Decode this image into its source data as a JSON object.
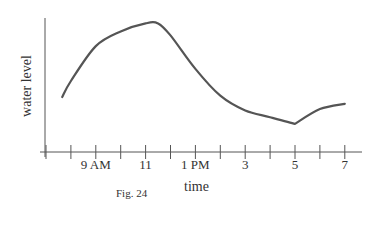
{
  "chart_data": {
    "type": "line",
    "title": "",
    "caption": "Fig. 24",
    "xlabel": "time",
    "ylabel": "water level",
    "x_ticks": [
      "7 AM",
      "8 AM",
      "9 AM",
      "10 AM",
      "11 AM",
      "12 PM",
      "1 PM",
      "2 PM",
      "3 PM",
      "4 PM",
      "5 PM",
      "6 PM",
      "7 PM"
    ],
    "x_tick_labels": [
      {
        "label": "9 AM",
        "hour": 9
      },
      {
        "label": "11",
        "hour": 11
      },
      {
        "label": "1 PM",
        "hour": 13
      },
      {
        "label": "3",
        "hour": 15
      },
      {
        "label": "5",
        "hour": 17
      },
      {
        "label": "7",
        "hour": 19
      }
    ],
    "x": [
      7.65,
      8,
      9,
      10,
      11,
      11.5,
      12,
      13,
      14,
      15,
      16,
      17,
      18,
      19
    ],
    "values": [
      4.1,
      5.3,
      7.9,
      9.0,
      9.6,
      9.6,
      8.7,
      6.2,
      4.2,
      3.1,
      2.6,
      2.1,
      3.2,
      3.6
    ],
    "series": [
      {
        "name": "water level",
        "x": [
          7.65,
          8,
          9,
          10,
          11,
          11.5,
          12,
          13,
          14,
          15,
          16,
          17,
          18,
          19
        ],
        "values": [
          4.1,
          5.3,
          7.9,
          9.0,
          9.6,
          9.6,
          8.7,
          6.2,
          4.2,
          3.1,
          2.6,
          2.1,
          3.2,
          3.6
        ]
      }
    ],
    "xlim": [
      7,
      19.7
    ],
    "ylim": [
      0,
      10
    ],
    "y_ticks": [],
    "grid": false,
    "legend": null,
    "annotations": [
      "local minimum (sharp dip) at 5",
      "peak around 11–11:30 AM"
    ]
  },
  "colors": {
    "line": "#555555",
    "axis": "#555555",
    "text": "#333333"
  }
}
